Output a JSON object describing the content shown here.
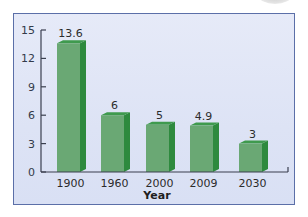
{
  "chart_data": {
    "type": "bar",
    "title": "",
    "xlabel": "Year",
    "ylabel": "",
    "categories": [
      "1900",
      "1960",
      "2000",
      "2009",
      "2030"
    ],
    "values": [
      13.6,
      6,
      5,
      4.9,
      3
    ],
    "value_labels": [
      "13.6",
      "6",
      "5",
      "4.9",
      "3"
    ],
    "ylim": [
      0,
      15
    ],
    "yticks": [
      0,
      3,
      6,
      9,
      12,
      15
    ],
    "grid": false,
    "legend": null,
    "style": "3d-bar"
  },
  "colors": {
    "bar_front": "#6aa874",
    "bar_side": "#2e8a3e",
    "bar_top": "#3f9a4e",
    "background": "#dde3f5",
    "border": "#5b6fa8",
    "axis": "#3a3f4f"
  }
}
